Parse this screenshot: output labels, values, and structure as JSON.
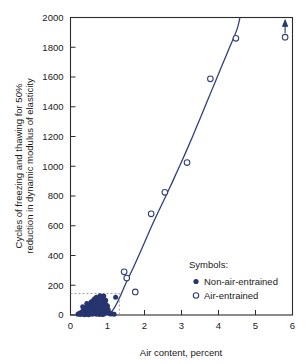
{
  "chart_data": {
    "type": "scatter",
    "title": "",
    "xlabel": "Air content, percent",
    "ylabel": "Cycles of freezing and thawing for 50% reduction in dynamic modulus of elasticity",
    "ylabel_line1": "Cycles of freezing and thawing for 50%",
    "ylabel_line2": "reduction in dynamic modulus of elasticity",
    "xlim": [
      0,
      6
    ],
    "ylim": [
      0,
      2000
    ],
    "xticks": [
      0,
      1,
      2,
      3,
      4,
      5,
      6
    ],
    "xtick_labels": [
      "0",
      "1",
      "2",
      "3",
      "4",
      "5",
      "6"
    ],
    "yticks": [
      0,
      200,
      400,
      600,
      800,
      1000,
      1200,
      1400,
      1600,
      1800,
      2000
    ],
    "ytick_labels": [
      "0",
      "200",
      "400",
      "600",
      "800",
      "1000",
      "1200",
      "1400",
      "1600",
      "1800",
      "2000"
    ],
    "grid": false,
    "legend_position": "inside-lower-right",
    "legend_title": "Symbols:",
    "series": [
      {
        "name": "Non-air-entrained",
        "marker": "filled-circle",
        "color": "#26356f",
        "points": [
          [
            0.2,
            5
          ],
          [
            0.24,
            12
          ],
          [
            0.27,
            3
          ],
          [
            0.3,
            20
          ],
          [
            0.32,
            8
          ],
          [
            0.35,
            30
          ],
          [
            0.36,
            14
          ],
          [
            0.38,
            2
          ],
          [
            0.4,
            45
          ],
          [
            0.41,
            22
          ],
          [
            0.43,
            9
          ],
          [
            0.45,
            60
          ],
          [
            0.46,
            33
          ],
          [
            0.47,
            16
          ],
          [
            0.48,
            4
          ],
          [
            0.5,
            70
          ],
          [
            0.51,
            40
          ],
          [
            0.52,
            25
          ],
          [
            0.53,
            11
          ],
          [
            0.55,
            85
          ],
          [
            0.56,
            52
          ],
          [
            0.57,
            30
          ],
          [
            0.58,
            15
          ],
          [
            0.59,
            5
          ],
          [
            0.6,
            95
          ],
          [
            0.61,
            64
          ],
          [
            0.62,
            42
          ],
          [
            0.63,
            24
          ],
          [
            0.64,
            10
          ],
          [
            0.65,
            110
          ],
          [
            0.66,
            75
          ],
          [
            0.67,
            50
          ],
          [
            0.68,
            33
          ],
          [
            0.69,
            18
          ],
          [
            0.7,
            120
          ],
          [
            0.71,
            88
          ],
          [
            0.72,
            60
          ],
          [
            0.73,
            40
          ],
          [
            0.74,
            22
          ],
          [
            0.75,
            8
          ],
          [
            0.76,
            100
          ],
          [
            0.77,
            72
          ],
          [
            0.78,
            48
          ],
          [
            0.79,
            28
          ],
          [
            0.8,
            130
          ],
          [
            0.81,
            92
          ],
          [
            0.82,
            62
          ],
          [
            0.83,
            38
          ],
          [
            0.84,
            18
          ],
          [
            0.85,
            6
          ],
          [
            0.86,
            105
          ],
          [
            0.87,
            78
          ],
          [
            0.88,
            52
          ],
          [
            0.89,
            30
          ],
          [
            0.9,
            128
          ],
          [
            0.91,
            86
          ],
          [
            0.92,
            58
          ],
          [
            0.93,
            35
          ],
          [
            0.94,
            14
          ],
          [
            0.95,
            100
          ],
          [
            0.96,
            70
          ],
          [
            0.97,
            45
          ],
          [
            0.98,
            22
          ],
          [
            1.0,
            60
          ],
          [
            1.02,
            35
          ],
          [
            1.05,
            15
          ],
          [
            1.08,
            6
          ],
          [
            1.12,
            8
          ],
          [
            1.18,
            5
          ],
          [
            1.22,
            120
          ],
          [
            0.44,
            78
          ],
          [
            0.54,
            18
          ],
          [
            0.64,
            68
          ],
          [
            0.74,
            95
          ],
          [
            0.84,
            72
          ],
          [
            0.33,
            55
          ],
          [
            0.49,
            2
          ],
          [
            0.7,
            5
          ],
          [
            0.79,
            4
          ],
          [
            0.88,
            3
          ]
        ]
      },
      {
        "name": "Air-entrained",
        "marker": "open-circle",
        "color": "#31407d",
        "points": [
          [
            1.45,
            290
          ],
          [
            1.52,
            248
          ],
          [
            1.75,
            155
          ],
          [
            2.18,
            680
          ],
          [
            2.55,
            825
          ],
          [
            3.15,
            1025
          ],
          [
            3.78,
            1588
          ],
          [
            4.47,
            1860
          ],
          [
            5.8,
            1868
          ]
        ],
        "arrow_points": [
          [
            5.8,
            1868
          ]
        ]
      }
    ],
    "fit_curve": {
      "name": "trend",
      "color": "#31407d",
      "points": [
        [
          1.05,
          0
        ],
        [
          1.2,
          55
        ],
        [
          1.35,
          130
        ],
        [
          1.5,
          215
        ],
        [
          1.7,
          320
        ],
        [
          1.9,
          430
        ],
        [
          2.1,
          545
        ],
        [
          2.3,
          655
        ],
        [
          2.5,
          760
        ],
        [
          2.7,
          865
        ],
        [
          2.9,
          975
        ],
        [
          3.1,
          1085
        ],
        [
          3.3,
          1200
        ],
        [
          3.5,
          1320
        ],
        [
          3.7,
          1440
        ],
        [
          3.9,
          1560
        ],
        [
          4.1,
          1680
        ],
        [
          4.3,
          1800
        ],
        [
          4.5,
          1920
        ],
        [
          4.58,
          2000
        ]
      ]
    },
    "annotation_box": {
      "name": "non-air-entrained-range-box",
      "style": "dashed",
      "color": "#8f8f8f",
      "x_range": [
        0,
        1.32
      ],
      "y_range": [
        0,
        145
      ]
    }
  },
  "legend": {
    "title": "Symbols:",
    "entries": [
      {
        "label": "Non-air-entrained",
        "marker": "filled-circle"
      },
      {
        "label": "Air-entrained",
        "marker": "open-circle"
      }
    ]
  },
  "colors": {
    "data_navy": "#26356f",
    "curve_navy": "#31407d",
    "axis": "#2b2b2b",
    "dashed_gray": "#8f8f8f",
    "background": "#ffffff"
  }
}
